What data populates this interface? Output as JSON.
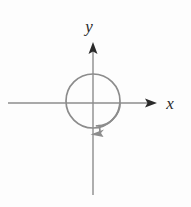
{
  "figure": {
    "width": 191,
    "height": 207,
    "background_color": "#fdfdfd"
  },
  "axes": {
    "x_axis": {
      "label": "x",
      "line_color": "#8c8c8c",
      "arrow_color": "#2a2a2a",
      "y_position": 103,
      "start_x": 8,
      "end_x": 157,
      "label_x": 170,
      "label_y": 109
    },
    "y_axis": {
      "label": "y",
      "line_color": "#8c8c8c",
      "arrow_color": "#2a2a2a",
      "x_position": 93,
      "start_y": 195,
      "end_y": 42,
      "label_x": 89,
      "label_y": 32
    }
  },
  "circle": {
    "center_x": 93,
    "center_y": 101,
    "radius": 27,
    "stroke_color": "#8c8c8c",
    "stroke_width": 1.6,
    "fill": "none"
  },
  "rotation_arc": {
    "description": "clockwise spiral arc inside and below the circle",
    "stroke_color": "#8c8c8c",
    "stroke_width": 1.6,
    "start_x": 120,
    "start_y": 103,
    "arrow_tip_x": 92,
    "arrow_tip_y": 134,
    "direction": "clockwise",
    "arrow_color": "#8c8c8c"
  },
  "colors": {
    "line_gray": "#8c8c8c",
    "arrow_dark": "#2a2a2a",
    "label_dark": "#2a2a2a",
    "background": "#fdfdfd"
  }
}
